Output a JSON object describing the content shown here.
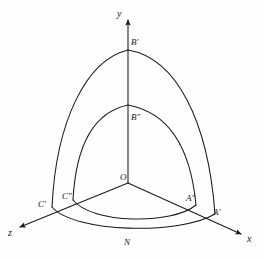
{
  "figure": {
    "background_color": "#fefefe",
    "stroke_color": "#1a1a1a"
  },
  "axes": [
    {
      "id": "y-axis",
      "label": "y",
      "direction": "up",
      "label_x": 117,
      "label_y": 9
    },
    {
      "id": "x-axis",
      "label": "x",
      "direction": "down-right",
      "label_x": 247,
      "label_y": 234
    },
    {
      "id": "z-axis",
      "label": "z",
      "direction": "down-left",
      "label_x": 8,
      "label_y": 228
    }
  ],
  "points": [
    {
      "id": "origin",
      "label": "O",
      "label_x": 120,
      "label_y": 173
    },
    {
      "id": "b-prime",
      "label": "B'",
      "label_x": 131,
      "label_y": 38
    },
    {
      "id": "b-dprime",
      "label": "B″",
      "label_x": 131,
      "label_y": 113
    },
    {
      "id": "a-prime",
      "label": "A'",
      "label_x": 213,
      "label_y": 208
    },
    {
      "id": "a-dprime",
      "label": "A″",
      "label_x": 186,
      "label_y": 194
    },
    {
      "id": "c-prime",
      "label": "C'",
      "label_x": 38,
      "label_y": 200
    },
    {
      "id": "c-dprime",
      "label": "C″",
      "label_x": 62,
      "label_y": 192
    },
    {
      "id": "n-point",
      "label": "N",
      "label_x": 124,
      "label_y": 238
    }
  ],
  "geometry": {
    "origin": {
      "x": 128,
      "y": 183
    },
    "outer": {
      "apex_y": {
        "x": 128,
        "y": 50
      },
      "right_x": {
        "x": 215,
        "y": 214
      },
      "left_z": {
        "x": 52,
        "y": 207
      },
      "front_n": {
        "x": 128,
        "y": 236
      }
    },
    "inner": {
      "apex_y": {
        "x": 128,
        "y": 105
      },
      "right_x": {
        "x": 196,
        "y": 205
      },
      "left_z": {
        "x": 73,
        "y": 200
      },
      "front_n": {
        "x": 128,
        "y": 227
      }
    }
  }
}
